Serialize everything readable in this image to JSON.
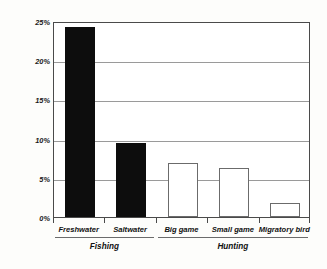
{
  "chart_data": {
    "type": "bar",
    "title": "",
    "xlabel": "",
    "ylabel": "percent participating",
    "categories": [
      "Freshwater",
      "Saltwater",
      "Big game",
      "Small game",
      "Migratory bird"
    ],
    "values": [
      24.2,
      9.4,
      6.9,
      6.2,
      1.8
    ],
    "series": [
      {
        "name": "percent participating",
        "values": [
          24.2,
          9.4,
          6.9,
          6.2,
          1.8
        ]
      }
    ],
    "bar_styles": [
      "filled",
      "filled",
      "hollow",
      "hollow",
      "hollow"
    ],
    "groups": [
      {
        "label": "Fishing",
        "categories": [
          "Freshwater",
          "Saltwater"
        ]
      },
      {
        "label": "Hunting",
        "categories": [
          "Big game",
          "Small game",
          "Migratory bird"
        ]
      }
    ],
    "ylim": [
      0,
      25
    ],
    "ytick_values": [
      0,
      5,
      10,
      15,
      20,
      25
    ],
    "ytick_labels": [
      "0%",
      "5%",
      "10%",
      "15%",
      "20%",
      "25%"
    ],
    "grid": true,
    "grid_axis": "y",
    "legend": "none",
    "colors": {
      "bar_filled": "#0d0d0d",
      "bar_hollow_fill": "#ffffff",
      "bar_hollow_edge": "#6b6b6b",
      "gridline": "#9a9a9a",
      "frame": "#4a4a4a",
      "text": "#111111",
      "background": "#ffffff"
    }
  }
}
